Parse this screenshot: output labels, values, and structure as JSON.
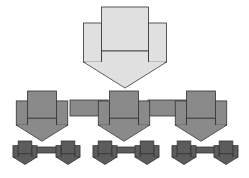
{
  "diagram": {
    "type": "hierarchy",
    "colors": {
      "level0_fill": "#e0e0e0",
      "level1_fill": "#8a8a8a",
      "level2_fill": "#5c5c5c",
      "stroke": "#333333"
    },
    "levels": [
      {
        "level": 0,
        "nodes": [
          "root"
        ]
      },
      {
        "level": 1,
        "nodes": [
          "child-1",
          "child-2",
          "child-3"
        ],
        "connected": true
      },
      {
        "level": 2,
        "nodes": [
          "grandchild-1a",
          "grandchild-1b",
          "grandchild-2a",
          "grandchild-2b",
          "grandchild-3a",
          "grandchild-3b"
        ],
        "connected_pairs": [
          [
            "grandchild-1a",
            "grandchild-1b"
          ],
          [
            "grandchild-2a",
            "grandchild-2b"
          ],
          [
            "grandchild-3a",
            "grandchild-3b"
          ]
        ]
      }
    ]
  }
}
